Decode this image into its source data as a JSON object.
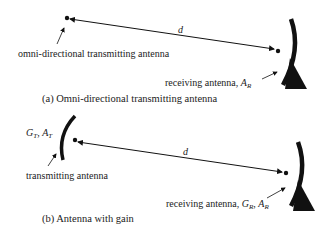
{
  "panel_a": {
    "distance_label": "d",
    "transmitter_label": "omni-directional transmitting antenna",
    "receiver_label": "receiving antenna, ",
    "receiver_symbol": "A",
    "receiver_symbol_sub": "R",
    "caption": "(a) Omni-directional transmitting antenna"
  },
  "panel_b": {
    "distance_label": "d",
    "tx_symbol_g": "G",
    "tx_symbol_g_sub": "T",
    "tx_symbol_a": "A",
    "tx_symbol_a_sub": "T",
    "transmitter_label": "transmitting antenna",
    "receiver_label": "receiving antenna, ",
    "rx_symbol_g": "G",
    "rx_symbol_g_sub": "R",
    "rx_symbol_a": "A",
    "rx_symbol_a_sub": "R",
    "caption": "(b) Antenna with gain"
  },
  "colors": {
    "ink": "#111111",
    "text": "#222222",
    "background": "#ffffff"
  }
}
